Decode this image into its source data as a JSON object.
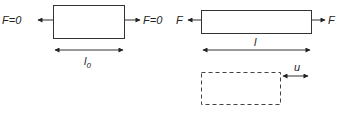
{
  "diagram": {
    "left_panel": {
      "left_force_label": "F=0",
      "right_force_label": "F=0",
      "length_label": "l",
      "length_subscript": "0"
    },
    "right_panel": {
      "left_force_label": "F",
      "right_force_label": "F",
      "length_label": "l",
      "displacement_label": "u"
    },
    "colors": {
      "stroke": "#333333",
      "text": "#222222"
    }
  }
}
